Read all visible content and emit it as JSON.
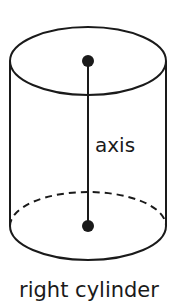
{
  "diagram": {
    "axis_label": "axis",
    "caption": "right cylinder",
    "colors": {
      "stroke": "#1a1a1a",
      "background": "#ffffff"
    }
  }
}
